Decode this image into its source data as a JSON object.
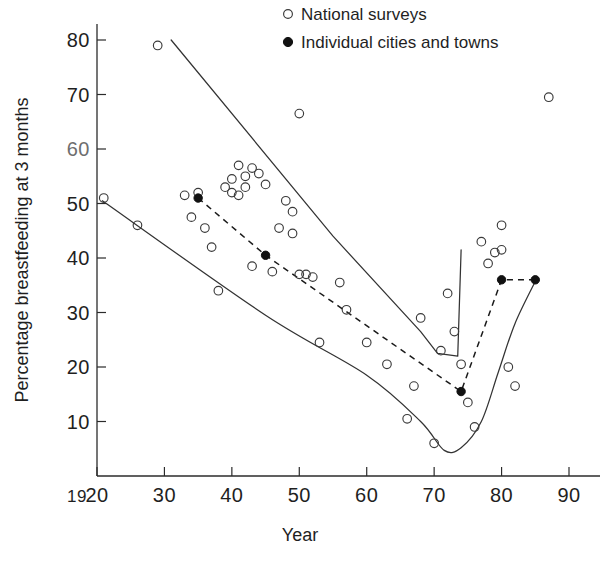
{
  "chart_data": {
    "type": "scatter",
    "title": "",
    "xlabel": "Year",
    "ylabel": "Percentage breastfeeding at 3 months",
    "xlim": [
      1920,
      1990
    ],
    "ylim": [
      0,
      85
    ],
    "grid": false,
    "x_prefix_label": "19",
    "x_tick_labels": [
      "20",
      "30",
      "40",
      "50",
      "60",
      "70",
      "80",
      "90"
    ],
    "x_tick_values": [
      1920,
      1930,
      1940,
      1950,
      1960,
      1970,
      1980,
      1990
    ],
    "y_tick_labels": [
      "10",
      "20",
      "30",
      "40",
      "50",
      "60",
      "70",
      "80"
    ],
    "y_tick_values": [
      10,
      20,
      30,
      40,
      50,
      60,
      70,
      80
    ],
    "legend": {
      "position": "top-right",
      "entries": [
        {
          "marker": "open-circle",
          "label": "National surveys"
        },
        {
          "marker": "filled-circle",
          "label": "Individual cities and towns"
        }
      ]
    },
    "series": [
      {
        "name": "National surveys",
        "marker": "open-circle",
        "points": [
          [
            1921,
            51.0
          ],
          [
            1926,
            46.0
          ],
          [
            1929,
            79.0
          ],
          [
            1933,
            51.5
          ],
          [
            1934,
            47.5
          ],
          [
            1935,
            52.0
          ],
          [
            1936,
            45.5
          ],
          [
            1937,
            42.0
          ],
          [
            1938,
            34.0
          ],
          [
            1939,
            53.0
          ],
          [
            1940,
            54.5
          ],
          [
            1940,
            52.0
          ],
          [
            1941,
            51.5
          ],
          [
            1941,
            57.0
          ],
          [
            1942,
            55.0
          ],
          [
            1942,
            53.0
          ],
          [
            1943,
            56.5
          ],
          [
            1943,
            38.5
          ],
          [
            1944,
            55.5
          ],
          [
            1945,
            53.5
          ],
          [
            1946,
            37.5
          ],
          [
            1947,
            45.5
          ],
          [
            1948,
            50.5
          ],
          [
            1949,
            48.5
          ],
          [
            1949,
            44.5
          ],
          [
            1950,
            66.5
          ],
          [
            1950,
            37.0
          ],
          [
            1951,
            37.0
          ],
          [
            1952,
            36.5
          ],
          [
            1953,
            24.5
          ],
          [
            1956,
            35.5
          ],
          [
            1957,
            30.5
          ],
          [
            1960,
            24.5
          ],
          [
            1963,
            20.5
          ],
          [
            1966,
            10.5
          ],
          [
            1967,
            16.5
          ],
          [
            1968,
            29.0
          ],
          [
            1970,
            6.0
          ],
          [
            1971,
            23.0
          ],
          [
            1972,
            33.5
          ],
          [
            1973,
            26.5
          ],
          [
            1974,
            20.5
          ],
          [
            1975,
            13.5
          ],
          [
            1976,
            9.0
          ],
          [
            1977,
            43.0
          ],
          [
            1978,
            39.0
          ],
          [
            1979,
            41.0
          ],
          [
            1980,
            46.0
          ],
          [
            1980,
            41.5
          ],
          [
            1981,
            20.0
          ],
          [
            1982,
            16.5
          ],
          [
            1987,
            69.5
          ]
        ]
      },
      {
        "name": "Individual cities and towns",
        "marker": "filled-circle",
        "connector": "dashed",
        "points": [
          [
            1935,
            51.0
          ],
          [
            1945,
            40.5
          ],
          [
            1974,
            15.5
          ],
          [
            1980,
            36.0
          ],
          [
            1985,
            36.0
          ]
        ]
      }
    ],
    "envelopes": [
      {
        "name": "upper-envelope",
        "style": "solid",
        "points": [
          [
            1931,
            80.0
          ],
          [
            1955,
            44.0
          ],
          [
            1968,
            26.5
          ],
          [
            1970.5,
            22.5
          ],
          [
            1973.5,
            22.0
          ],
          [
            1974.0,
            41.5
          ]
        ]
      },
      {
        "name": "lower-envelope",
        "style": "solid",
        "points": [
          [
            1920.8,
            50.5
          ],
          [
            1945,
            29.5
          ],
          [
            1960,
            18.5
          ],
          [
            1968,
            10.0
          ],
          [
            1971.5,
            4.7
          ],
          [
            1974,
            5.2
          ],
          [
            1977,
            10.0
          ],
          [
            1979.5,
            19.0
          ],
          [
            1982,
            28.0
          ],
          [
            1985.2,
            36.2
          ]
        ]
      }
    ]
  },
  "axes": {
    "x_title": "Year",
    "y_title": "Percentage breastfeeding at 3 months"
  }
}
